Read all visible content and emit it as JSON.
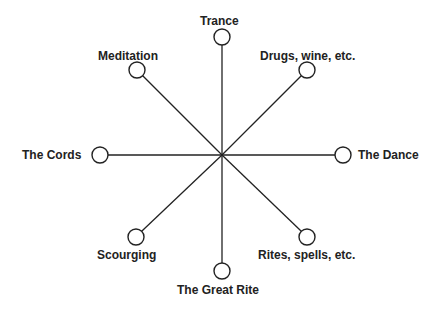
{
  "diagram": {
    "type": "radial-spoke",
    "center": {
      "x": 222,
      "y": 155
    },
    "line_color": "#222222",
    "nodes": [
      {
        "label": "Trance",
        "circle": {
          "x": 222,
          "y": 37
        }
      },
      {
        "label": "Drugs, wine, etc.",
        "circle": {
          "x": 307,
          "y": 70
        }
      },
      {
        "label": "The Dance",
        "circle": {
          "x": 343,
          "y": 155
        }
      },
      {
        "label": "Rites, spells, etc.",
        "circle": {
          "x": 307,
          "y": 237
        }
      },
      {
        "label": "The Great Rite",
        "circle": {
          "x": 222,
          "y": 271
        }
      },
      {
        "label": "Scourging",
        "circle": {
          "x": 136,
          "y": 237
        }
      },
      {
        "label": "The Cords",
        "circle": {
          "x": 100,
          "y": 155
        }
      },
      {
        "label": "Meditation",
        "circle": {
          "x": 137,
          "y": 70
        }
      }
    ]
  }
}
